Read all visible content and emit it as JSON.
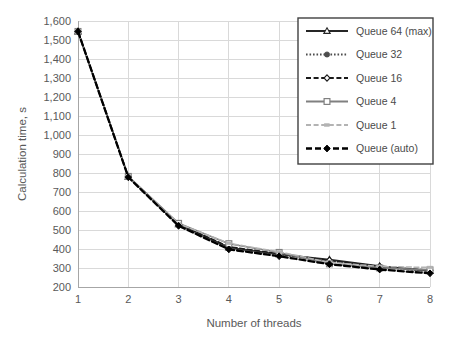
{
  "chart_data": {
    "type": "line",
    "title": "",
    "xlabel": "Number of threads",
    "ylabel": "Calculation time, s",
    "x": [
      1,
      2,
      3,
      4,
      5,
      6,
      7,
      8
    ],
    "xlim": [
      1,
      8
    ],
    "ylim": [
      200,
      1600
    ],
    "xticks": [
      "1",
      "2",
      "3",
      "4",
      "5",
      "6",
      "7",
      "8"
    ],
    "yticks": [
      "200",
      "300",
      "400",
      "500",
      "600",
      "700",
      "800",
      "900",
      "1,000",
      "1,100",
      "1,200",
      "1,300",
      "1,400",
      "1,500",
      "1,600"
    ],
    "grid": true,
    "legend_position": "top-right-inside",
    "series": [
      {
        "name": "Queue 64 (max)",
        "values": [
          1545,
          780,
          530,
          408,
          372,
          345,
          310,
          285
        ],
        "color": "#262626",
        "line_style": "solid",
        "marker": "triangle-open"
      },
      {
        "name": "Queue 32",
        "values": [
          1545,
          780,
          528,
          404,
          370,
          337,
          305,
          282
        ],
        "color": "#4d4d4d",
        "line_style": "dotted",
        "marker": "circle-filled"
      },
      {
        "name": "Queue 16",
        "values": [
          1545,
          780,
          532,
          412,
          375,
          340,
          308,
          288
        ],
        "color": "#1a1a1a",
        "line_style": "dashed",
        "marker": "diamond-open"
      },
      {
        "name": "Queue 4",
        "values": [
          1545,
          782,
          535,
          428,
          382,
          322,
          300,
          290
        ],
        "color": "#808080",
        "line_style": "solid",
        "marker": "square-open"
      },
      {
        "name": "Queue 1",
        "values": [
          1545,
          780,
          533,
          430,
          385,
          330,
          308,
          303
        ],
        "color": "#b3b3b3",
        "line_style": "dashed",
        "marker": "dash-small"
      },
      {
        "name": "Queue (auto)",
        "values": [
          1545,
          778,
          522,
          398,
          362,
          320,
          292,
          272
        ],
        "color": "#000000",
        "line_style": "dashed-bold",
        "marker": "diamond-filled"
      }
    ]
  },
  "axes": {
    "y_title": "Calculation time, s",
    "x_title": "Number of threads"
  }
}
